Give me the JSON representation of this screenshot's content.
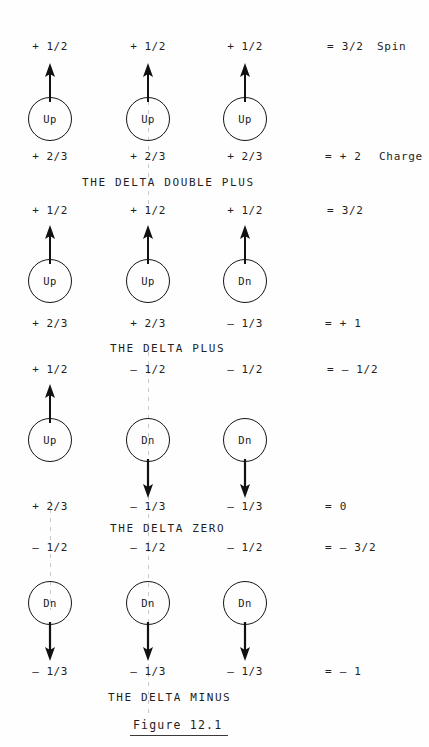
{
  "figure": {
    "caption": "Figure  12.1",
    "column_header_spin": "Spin",
    "column_header_charge": "Charge"
  },
  "groups": [
    {
      "name": "THE DELTA DOUBLE PLUS",
      "spin_total": "= 3/2",
      "charge_total": "= +   2",
      "quarks": [
        {
          "spin": "+ 1/2",
          "flavor": "Up",
          "charge": "+ 2/3",
          "direction": "up"
        },
        {
          "spin": "+ 1/2",
          "flavor": "Up",
          "charge": "+ 2/3",
          "direction": "up"
        },
        {
          "spin": "+ 1/2",
          "flavor": "Up",
          "charge": "+ 2/3",
          "direction": "up"
        }
      ]
    },
    {
      "name": "THE DELTA PLUS",
      "spin_total": "= 3/2",
      "charge_total": "= + 1",
      "quarks": [
        {
          "spin": "+ 1/2",
          "flavor": "Up",
          "charge": "+ 2/3",
          "direction": "up"
        },
        {
          "spin": "+ 1/2",
          "flavor": "Up",
          "charge": "+ 2/3",
          "direction": "up"
        },
        {
          "spin": "+ 1/2",
          "flavor": "Dn",
          "charge": "– 1/3",
          "direction": "up"
        }
      ]
    },
    {
      "name": "THE DELTA ZERO",
      "spin_total": "= – 1/2",
      "charge_total": "= 0",
      "quarks": [
        {
          "spin": "+ 1/2",
          "flavor": "Up",
          "charge": "+ 2/3",
          "direction": "up"
        },
        {
          "spin": "– 1/2",
          "flavor": "Dn",
          "charge": "– 1/3",
          "direction": "down"
        },
        {
          "spin": "– 1/2",
          "flavor": "Dn",
          "charge": "– 1/3",
          "direction": "down"
        }
      ]
    },
    {
      "name": "THE DELTA MINUS",
      "spin_total": "= – 3/2",
      "charge_total": "= – 1",
      "quarks": [
        {
          "spin": "– 1/2",
          "flavor": "Dn",
          "charge": "– 1/3",
          "direction": "down"
        },
        {
          "spin": "– 1/2",
          "flavor": "Dn",
          "charge": "– 1/3",
          "direction": "down"
        },
        {
          "spin": "– 1/2",
          "flavor": "Dn",
          "charge": "– 1/3",
          "direction": "down"
        }
      ]
    }
  ],
  "colors": {
    "ink": "#1a1a1a",
    "paper": "#ffffff"
  }
}
